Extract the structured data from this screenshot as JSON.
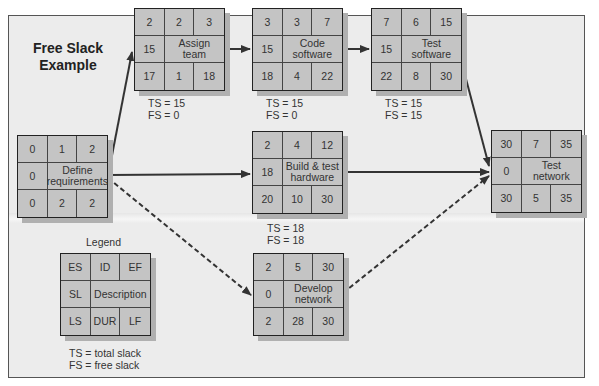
{
  "title": "Free Slack Example",
  "nodes": {
    "define": {
      "es": "0",
      "id": "1",
      "ef": "2",
      "sl": "0",
      "desc": "Define requirements",
      "ls": "0",
      "dur": "2",
      "lf": "2"
    },
    "assign": {
      "es": "2",
      "id": "2",
      "ef": "3",
      "sl": "15",
      "desc": "Assign team",
      "ls": "17",
      "dur": "1",
      "lf": "18",
      "ts": "TS = 15",
      "fs": "FS = 0"
    },
    "code": {
      "es": "3",
      "id": "3",
      "ef": "7",
      "sl": "15",
      "desc": "Code software",
      "ls": "18",
      "dur": "4",
      "lf": "22",
      "ts": "TS = 15",
      "fs": "FS = 0"
    },
    "testsw": {
      "es": "7",
      "id": "6",
      "ef": "15",
      "sl": "15",
      "desc": "Test software",
      "ls": "22",
      "dur": "8",
      "lf": "30",
      "ts": "TS = 15",
      "fs": "FS = 15"
    },
    "build": {
      "es": "2",
      "id": "4",
      "ef": "12",
      "sl": "18",
      "desc": "Build & test hardware",
      "ls": "20",
      "dur": "10",
      "lf": "30",
      "ts": "TS = 18",
      "fs": "FS = 18"
    },
    "develop": {
      "es": "2",
      "id": "5",
      "ef": "30",
      "sl": "0",
      "desc": "Develop network",
      "ls": "2",
      "dur": "28",
      "lf": "30"
    },
    "testnet": {
      "es": "30",
      "id": "7",
      "ef": "35",
      "sl": "0",
      "desc": "Test network",
      "ls": "30",
      "dur": "5",
      "lf": "35"
    }
  },
  "legend": {
    "title": "Legend",
    "es": "ES",
    "id": "ID",
    "ef": "EF",
    "sl": "SL",
    "desc": "Description",
    "ls": "LS",
    "dur": "DUR",
    "lf": "LF",
    "ts_def": "TS = total slack",
    "fs_def": "FS = free slack"
  },
  "edges": [
    {
      "from": "define",
      "to": "assign",
      "style": "solid"
    },
    {
      "from": "assign",
      "to": "code",
      "style": "solid"
    },
    {
      "from": "code",
      "to": "testsw",
      "style": "solid"
    },
    {
      "from": "testsw",
      "to": "testnet",
      "style": "solid"
    },
    {
      "from": "define",
      "to": "build",
      "style": "solid"
    },
    {
      "from": "build",
      "to": "testnet",
      "style": "solid"
    },
    {
      "from": "define",
      "to": "develop",
      "style": "dashed"
    },
    {
      "from": "develop",
      "to": "testnet",
      "style": "dashed"
    }
  ],
  "colors": {
    "node_fill": "#c4c4c4",
    "frame_fill": "#ececec",
    "line": "#333333"
  }
}
